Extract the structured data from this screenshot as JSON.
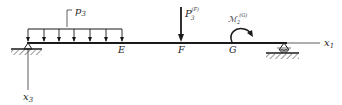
{
  "diagram": {
    "type": "beam-loading",
    "axes": {
      "x1_label": "x",
      "x1_sub": "1",
      "x3_label": "x",
      "x3_sub": "3"
    },
    "points": {
      "E": "E",
      "F": "F",
      "G": "G"
    },
    "loads": {
      "distributed": {
        "label": "p",
        "sub": "3",
        "arrow_count": 7
      },
      "point_force": {
        "label": "P",
        "sub": "3",
        "sup": "(F)"
      },
      "moment": {
        "label": "ℳ",
        "sub": "2",
        "sup": "(G)"
      }
    },
    "supports": {
      "left": "pin",
      "right": "roller"
    },
    "colors": {
      "line": "#1a1a1a",
      "text": "#222222"
    }
  }
}
